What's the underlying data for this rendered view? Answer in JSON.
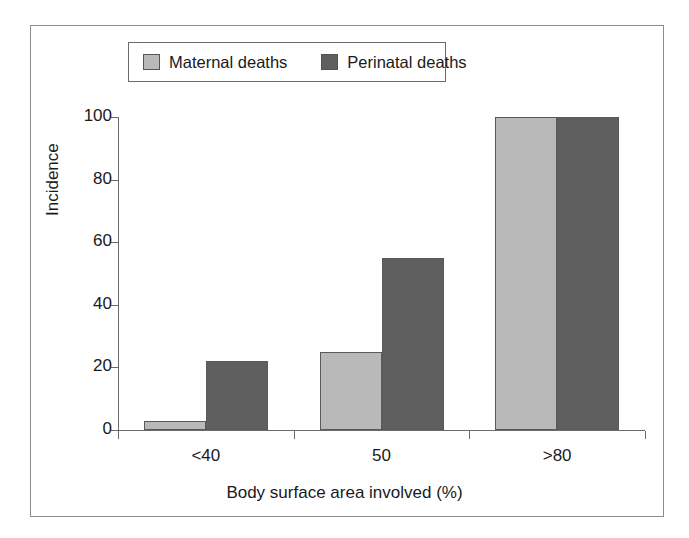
{
  "chart_data": {
    "type": "bar",
    "title": "",
    "subtitle": "",
    "xlabel": "Body surface area involved (%)",
    "ylabel": "Incidence",
    "categories": [
      "<40",
      "50",
      ">80"
    ],
    "series": [
      {
        "name": "Maternal deaths",
        "values": [
          3,
          25,
          100
        ],
        "color": "#b9b9b9"
      },
      {
        "name": "Perinatal deaths",
        "values": [
          22,
          55,
          100
        ],
        "color": "#5f5f5f"
      }
    ],
    "ylim": [
      0,
      100
    ],
    "yticks": [
      0,
      20,
      40,
      60,
      80,
      100
    ],
    "ytick_labels": [
      "0",
      "20",
      "40",
      "60",
      "80",
      "100"
    ],
    "grid": false,
    "legend_position": "top-center",
    "bar_edge_color": "#5a5a5a",
    "axis_color": "#6b6b6b",
    "frame_color": "#8c8c8c",
    "background": "#ffffff"
  }
}
